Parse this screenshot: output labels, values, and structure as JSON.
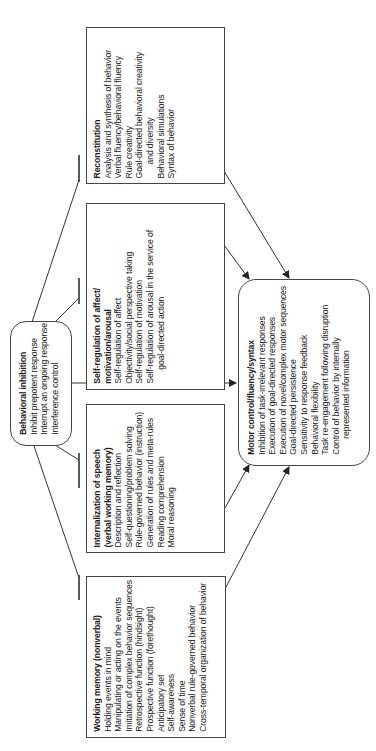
{
  "diagram": {
    "orientation": "rotated-90-ccw",
    "nodes": {
      "behavioral_inhibition": {
        "title": "Behavioral inhibition",
        "items": [
          "Inhibit prepotent response",
          "Interrupt an ongoing response",
          "Interference control"
        ]
      },
      "working_memory": {
        "title": "Working memory (nonverbal)",
        "items": [
          "Holding events in mind",
          "Manipulating or acting on the events",
          "Imitation of complex behavior sequences",
          "Retrospective function (hindsight)",
          "Prospective function (forethought)",
          "Anticipatory set",
          "Self-awareness",
          "Sense of time",
          "Nonverbal rule-governed behavior",
          "Cross-temporal organization of behavior"
        ]
      },
      "internalization_of_speech": {
        "title_line1": "Internalization of speech",
        "title_line2": "(verbal working memory)",
        "items": [
          "Description and reflection",
          "Self-questioning/problem solving",
          "Rule-governed behavior (instruction)",
          "Generation of rules and meta-rules",
          "Reading comprehension",
          "Moral reasoning"
        ]
      },
      "self_regulation": {
        "title_line1": "Self-regulation of affect/",
        "title_line2": "motivation/arousal",
        "items": [
          "Self-regulation of affect",
          "Objectivity/social perspective taking",
          "Self-regulation of motivation",
          "Self-regulation of arousal in the service of",
          "goal-directed action"
        ]
      },
      "reconstitution": {
        "title": "Reconstitution",
        "items": [
          "Analysis and synthesis of behavior",
          "Verbal fluency/behavioral fluency",
          "Rule creativity",
          "Goal-directed behavioral creativity",
          "and diversity",
          "Behavioral simulations",
          "Syntax of behavior"
        ]
      },
      "motor_control": {
        "title": "Motor control/fluency/syntax",
        "items": [
          "Inhibition of task-irrelevant responses",
          "Execution of goal-directed responses",
          "Execution of novel/complex motor sequences",
          "Goal-directed persistence",
          "Sensitivity to response feedback",
          "Behavioral flexibility",
          "Task re-engagement following disruption",
          "Control of behavior by internally",
          "represented information"
        ]
      }
    },
    "edges": [
      {
        "from": "behavioral_inhibition",
        "to": "working_memory",
        "type": "inhibit-bar"
      },
      {
        "from": "behavioral_inhibition",
        "to": "internalization_of_speech",
        "type": "inhibit-bar"
      },
      {
        "from": "behavioral_inhibition",
        "to": "self_regulation",
        "type": "inhibit-bar"
      },
      {
        "from": "behavioral_inhibition",
        "to": "reconstitution",
        "type": "inhibit-bar"
      },
      {
        "from": "behavioral_inhibition",
        "to": "motor_control",
        "type": "arrow"
      },
      {
        "from": "working_memory",
        "to": "motor_control",
        "type": "arrow"
      },
      {
        "from": "internalization_of_speech",
        "to": "motor_control",
        "type": "arrow"
      },
      {
        "from": "self_regulation",
        "to": "motor_control",
        "type": "arrow"
      },
      {
        "from": "reconstitution",
        "to": "motor_control",
        "type": "arrow"
      }
    ],
    "colors": {
      "line": "#333333",
      "box_border": "#444444",
      "background": "#ffffff"
    }
  }
}
